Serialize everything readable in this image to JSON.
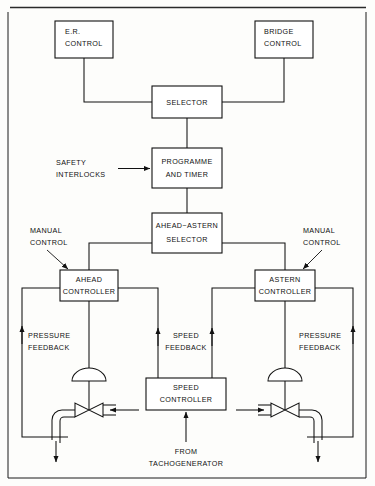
{
  "diagram": {
    "frame": {
      "visible": true
    },
    "boxes": {
      "er_control": "E.R.\nCONTROL",
      "er_control_line1": "E.R.",
      "er_control_line2": "CONTROL",
      "bridge_control_line1": "BRIDGE",
      "bridge_control_line2": "CONTROL",
      "selector": "SELECTOR",
      "programme_line1": "PROGRAMME",
      "programme_line2": "AND  TIMER",
      "ahead_astern_line1": "AHEAD−ASTERN",
      "ahead_astern_line2": "SELECTOR",
      "ahead_controller_line1": "AHEAD",
      "ahead_controller_line2": "CONTROLLER",
      "astern_controller_line1": "ASTERN",
      "astern_controller_line2": "CONTROLLER",
      "speed_controller_line1": "SPEED",
      "speed_controller_line2": "CONTROLLER"
    },
    "annotations": {
      "safety_line1": "SAFETY",
      "safety_line2": "INTERLOCKS",
      "manual_left_line1": "MANUAL",
      "manual_left_line2": "CONTROL",
      "manual_right_line1": "MANUAL",
      "manual_right_line2": "CONTROL",
      "pressure_left_line1": "PRESSURE",
      "pressure_left_line2": "FEEDBACK",
      "pressure_right_line1": "PRESSURE",
      "pressure_right_line2": "FEEDBACK",
      "speed_feedback_line1": "SPEED",
      "speed_feedback_line2": "FEEDBACK",
      "tacho_line1": "FROM",
      "tacho_line2": "TACHOGENERATOR"
    },
    "colors": {
      "ink": "#111111",
      "paper": "#fdfdfb"
    }
  }
}
